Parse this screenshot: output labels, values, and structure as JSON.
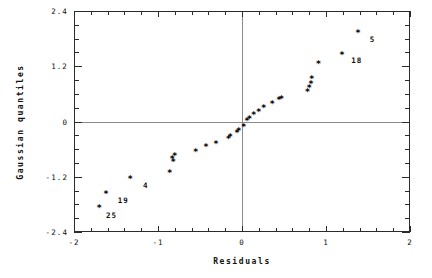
{
  "chart_data": {
    "type": "scatter",
    "title": "",
    "xlabel": "Residuals",
    "ylabel": "Gaussian quantiles",
    "xlim": [
      -2,
      2
    ],
    "ylim": [
      -2.4,
      2.4
    ],
    "x_major_ticks": [
      -2,
      -1,
      0,
      1,
      2
    ],
    "x_major_tick_labels": [
      "-2",
      "-1",
      "0",
      "1",
      "2"
    ],
    "x_minor_step": 0.2,
    "y_major_ticks": [
      2.4,
      1.2,
      0,
      -1.2,
      -2.4
    ],
    "y_major_tick_labels": [
      "2.4",
      "1.2",
      "0",
      "-1.2",
      "-2.4"
    ],
    "y_minor_step": 0.3,
    "grid": false,
    "legend": null,
    "marker": "*",
    "reference_lines": [
      {
        "orientation": "horizontal",
        "value": 0
      },
      {
        "orientation": "vertical",
        "value": 0
      }
    ],
    "points": [
      {
        "x": -1.7,
        "y": -1.88
      },
      {
        "x": -1.62,
        "y": -1.59
      },
      {
        "x": -1.33,
        "y": -1.26
      },
      {
        "x": -0.86,
        "y": -1.12
      },
      {
        "x": -0.82,
        "y": -0.89
      },
      {
        "x": -0.83,
        "y": -0.83
      },
      {
        "x": -0.8,
        "y": -0.77
      },
      {
        "x": -0.55,
        "y": -0.67
      },
      {
        "x": -0.43,
        "y": -0.57
      },
      {
        "x": -0.31,
        "y": -0.49
      },
      {
        "x": -0.16,
        "y": -0.4
      },
      {
        "x": -0.14,
        "y": -0.34
      },
      {
        "x": -0.06,
        "y": -0.26
      },
      {
        "x": -0.04,
        "y": -0.21
      },
      {
        "x": 0.02,
        "y": -0.12
      },
      {
        "x": 0.06,
        "y": 0.0
      },
      {
        "x": 0.09,
        "y": 0.05
      },
      {
        "x": 0.14,
        "y": 0.12
      },
      {
        "x": 0.2,
        "y": 0.2
      },
      {
        "x": 0.26,
        "y": 0.28
      },
      {
        "x": 0.36,
        "y": 0.38
      },
      {
        "x": 0.44,
        "y": 0.45
      },
      {
        "x": 0.47,
        "y": 0.47
      },
      {
        "x": 0.78,
        "y": 0.62
      },
      {
        "x": 0.8,
        "y": 0.72
      },
      {
        "x": 0.82,
        "y": 0.81
      },
      {
        "x": 0.83,
        "y": 0.92
      },
      {
        "x": 0.91,
        "y": 1.24
      },
      {
        "x": 1.19,
        "y": 1.44
      },
      {
        "x": 1.38,
        "y": 1.91
      }
    ],
    "annotations": [
      {
        "label": "25",
        "x": -1.62,
        "y": -2.02
      },
      {
        "label": "19",
        "x": -1.48,
        "y": -1.7
      },
      {
        "label": "4",
        "x": -1.18,
        "y": -1.37
      },
      {
        "label": "18",
        "x": 1.3,
        "y": 1.34
      },
      {
        "label": "5",
        "x": 1.52,
        "y": 1.8
      }
    ]
  },
  "geometry": {
    "plot_left": 74,
    "plot_top": 11,
    "plot_right": 410,
    "plot_bottom": 232
  }
}
